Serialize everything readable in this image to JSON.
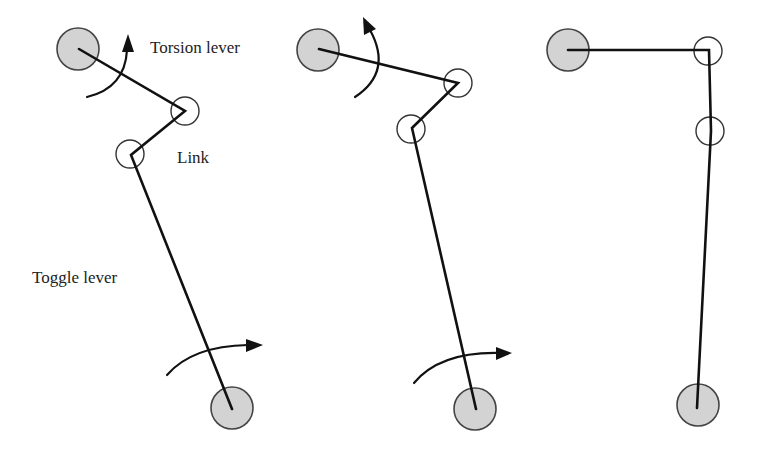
{
  "labels": {
    "torsion_lever": "Torsion lever",
    "link": "Link",
    "toggle_lever": "Toggle lever"
  },
  "colors": {
    "background": "#ffffff",
    "bar": "#111111",
    "pivot_fill": "#d3d3d3",
    "pivot_stroke": "#444444",
    "joint_stroke": "#333333",
    "text": "#222222"
  },
  "mechanisms": [
    {
      "name": "position-1",
      "top_pivot": [
        79,
        49
      ],
      "lever_link_joint": [
        185,
        111
      ],
      "link_toggle_joint": [
        131,
        155
      ],
      "bottom_pivot": [
        232,
        408
      ],
      "torsion_arrow": "counterclockwise",
      "toggle_arrow": "clockwise"
    },
    {
      "name": "position-2",
      "top_pivot": [
        319,
        49
      ],
      "lever_link_joint": [
        458,
        83
      ],
      "link_toggle_joint": [
        412,
        128
      ],
      "bottom_pivot": [
        476,
        409
      ],
      "torsion_arrow": "counterclockwise",
      "toggle_arrow": "clockwise"
    },
    {
      "name": "position-3-locked",
      "top_pivot": [
        568,
        50
      ],
      "lever_link_joint": [
        709,
        50
      ],
      "link_toggle_joint": [
        711,
        131
      ],
      "bottom_pivot": [
        697,
        408
      ]
    }
  ]
}
